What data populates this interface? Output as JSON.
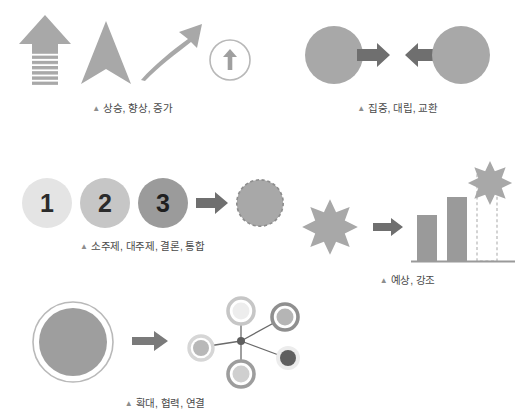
{
  "document": {
    "title": "프레젠테이션 픽토그램 표현 예시",
    "background_color": "#ffffff",
    "palette": {
      "gray_dark": "#6f6f6f",
      "gray_mid": "#9a9a9a",
      "gray_light": "#c9c9c9",
      "gray_lighter": "#dedede",
      "gray_pale": "#ebebeb",
      "outline": "#b0b0b0",
      "caption_text": "#4a4a4a",
      "caption_marker": "#8d8d8d"
    }
  },
  "panels": [
    {
      "id": "rise",
      "name": "상승 향상 증가",
      "caption": "상승, 향상, 증가",
      "marker": "▲",
      "icons": [
        {
          "name": "striped-up-arrow",
          "label": "빗금 상승 화살표"
        },
        {
          "name": "chevron-up-arrow",
          "label": "쐐기 상승 화살표"
        },
        {
          "name": "curved-growth-arrow",
          "label": "곡선 성장 화살표"
        },
        {
          "name": "circled-up-arrow",
          "label": "원형 상승 화살표"
        }
      ]
    },
    {
      "id": "converge",
      "name": "집중 대립 교환",
      "caption": "집중, 대립, 교환",
      "marker": "▲",
      "icons": [
        {
          "name": "left-circle",
          "label": "왼쪽 원"
        },
        {
          "name": "right-arrow",
          "label": "오른쪽 화살표"
        },
        {
          "name": "left-arrow",
          "label": "왼쪽 화살표"
        },
        {
          "name": "right-circle",
          "label": "오른쪽 원"
        }
      ]
    },
    {
      "id": "sequence",
      "name": "소주제 대주제 결론 통합",
      "caption": "소주제, 대주제, 결론, 통합",
      "marker": "▲",
      "steps": [
        {
          "number": "1",
          "shade": "#e4e4e4"
        },
        {
          "number": "2",
          "shade": "#c6c6c6"
        },
        {
          "number": "3",
          "shade": "#9b9b9b"
        }
      ],
      "icons": [
        {
          "name": "right-arrow",
          "label": "통합 화살표"
        },
        {
          "name": "dashed-merge-circle",
          "label": "점선 통합 원"
        }
      ]
    },
    {
      "id": "forecast",
      "name": "예상 강조",
      "caption": "예상, 강조",
      "marker": "▲",
      "icons": [
        {
          "name": "burst-star",
          "label": "폭발 별"
        },
        {
          "name": "right-arrow",
          "label": "전환 화살표"
        },
        {
          "name": "bar-chart",
          "label": "막대 그래프"
        },
        {
          "name": "burst-star-highlight",
          "label": "강조 별"
        }
      ],
      "chart": {
        "bars": [
          {
            "label": "",
            "value": 52,
            "style": "solid"
          },
          {
            "label": "",
            "value": 73,
            "style": "solid"
          },
          {
            "label": "",
            "value": 100,
            "style": "dashed"
          }
        ]
      }
    },
    {
      "id": "expand",
      "name": "확대 협력 연결",
      "caption": "확대, 협력, 연결",
      "marker": "▲",
      "icons": [
        {
          "name": "ringed-circle",
          "label": "테두리 원"
        },
        {
          "name": "right-arrow",
          "label": "확장 화살표"
        },
        {
          "name": "network-diagram",
          "label": "연결망"
        }
      ],
      "network": {
        "hub": {
          "name": "hub-node"
        },
        "nodes": [
          {
            "name": "node-top",
            "fill": "#ededed",
            "ring": "#c6c6c6"
          },
          {
            "name": "node-upper-right",
            "fill": "#b5b5b5",
            "ring": "#8f8f8f"
          },
          {
            "name": "node-left",
            "fill": "#b8b8b8",
            "ring": "#d6d6d6"
          },
          {
            "name": "node-lower-right",
            "fill": "#5f5f5f",
            "ring": "#ececec"
          },
          {
            "name": "node-bottom",
            "fill": "#cfcfcf",
            "ring": "#9d9d9d"
          }
        ]
      }
    }
  ]
}
